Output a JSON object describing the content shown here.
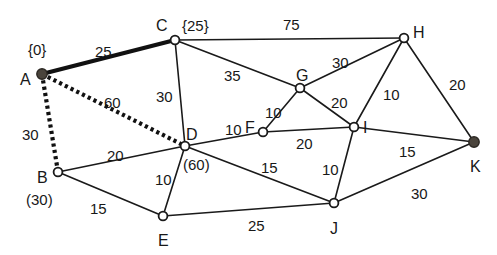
{
  "figure": {
    "background_color": "#ffffff",
    "line_color": "#1a1a1a",
    "filled_node_color": "#4a443c",
    "width": 497,
    "height": 255
  },
  "chart_data": {
    "type": "diagram",
    "subtype": "weighted-undirected-graph",
    "title": "",
    "nodes": [
      {
        "id": "A",
        "label": "A",
        "x": 42,
        "y": 74,
        "fill": "filled",
        "tag": "{0}",
        "tag_kind": "settled"
      },
      {
        "id": "B",
        "label": "B",
        "x": 58,
        "y": 172,
        "fill": "open",
        "tag": "(30)",
        "tag_kind": "tentative"
      },
      {
        "id": "C",
        "label": "C",
        "x": 175,
        "y": 40,
        "fill": "open",
        "tag": "{25}",
        "tag_kind": "settled"
      },
      {
        "id": "D",
        "label": "D",
        "x": 185,
        "y": 146,
        "fill": "open",
        "tag": "(60)",
        "tag_kind": "tentative"
      },
      {
        "id": "E",
        "label": "E",
        "x": 163,
        "y": 216,
        "fill": "open",
        "tag": "",
        "tag_kind": "none"
      },
      {
        "id": "F",
        "label": "F",
        "x": 263,
        "y": 132,
        "fill": "open",
        "tag": "",
        "tag_kind": "none"
      },
      {
        "id": "G",
        "label": "G",
        "x": 300,
        "y": 88,
        "fill": "open",
        "tag": "",
        "tag_kind": "none"
      },
      {
        "id": "H",
        "label": "H",
        "x": 404,
        "y": 38,
        "fill": "open",
        "tag": "",
        "tag_kind": "none"
      },
      {
        "id": "I",
        "label": "I",
        "x": 354,
        "y": 127,
        "fill": "open",
        "tag": "",
        "tag_kind": "none"
      },
      {
        "id": "J",
        "label": "J",
        "x": 334,
        "y": 203,
        "fill": "open",
        "tag": "",
        "tag_kind": "none"
      },
      {
        "id": "K",
        "label": "K",
        "x": 474,
        "y": 142,
        "fill": "filled",
        "tag": "",
        "tag_kind": "none"
      }
    ],
    "edges": [
      {
        "from": "A",
        "to": "C",
        "weight": 25,
        "style": "tree",
        "label_x": 95,
        "label_y": 44
      },
      {
        "from": "A",
        "to": "B",
        "weight": 30,
        "style": "dotted",
        "label_x": 22,
        "label_y": 127
      },
      {
        "from": "A",
        "to": "D",
        "weight": 60,
        "style": "dotted",
        "label_x": 104,
        "label_y": 95
      },
      {
        "from": "C",
        "to": "H",
        "weight": 75,
        "style": "plain",
        "label_x": 283,
        "label_y": 17
      },
      {
        "from": "C",
        "to": "D",
        "weight": 30,
        "style": "plain",
        "label_x": 156,
        "label_y": 89
      },
      {
        "from": "C",
        "to": "G",
        "weight": 35,
        "style": "plain",
        "label_x": 224,
        "label_y": 68
      },
      {
        "from": "B",
        "to": "D",
        "weight": 20,
        "style": "plain",
        "label_x": 107,
        "label_y": 148
      },
      {
        "from": "B",
        "to": "E",
        "weight": 15,
        "style": "plain",
        "label_x": 90,
        "label_y": 201
      },
      {
        "from": "D",
        "to": "E",
        "weight": 10,
        "style": "plain",
        "label_x": 155,
        "label_y": 172
      },
      {
        "from": "D",
        "to": "F",
        "weight": 10,
        "style": "plain",
        "label_x": 225,
        "label_y": 122
      },
      {
        "from": "D",
        "to": "J",
        "weight": 15,
        "style": "plain",
        "label_x": 261,
        "label_y": 160
      },
      {
        "from": "E",
        "to": "J",
        "weight": 25,
        "style": "plain",
        "label_x": 248,
        "label_y": 218
      },
      {
        "from": "F",
        "to": "G",
        "weight": 10,
        "style": "plain",
        "label_x": 265,
        "label_y": 105
      },
      {
        "from": "F",
        "to": "I",
        "weight": 20,
        "style": "plain",
        "label_x": 296,
        "label_y": 136
      },
      {
        "from": "G",
        "to": "H",
        "weight": 30,
        "style": "plain",
        "label_x": 332,
        "label_y": 55
      },
      {
        "from": "G",
        "to": "I",
        "weight": 20,
        "style": "plain",
        "label_x": 331,
        "label_y": 95
      },
      {
        "from": "H",
        "to": "I",
        "weight": 10,
        "style": "plain",
        "label_x": 383,
        "label_y": 87
      },
      {
        "from": "H",
        "to": "K",
        "weight": 20,
        "style": "plain",
        "label_x": 449,
        "label_y": 77
      },
      {
        "from": "I",
        "to": "J",
        "weight": 10,
        "style": "plain",
        "label_x": 322,
        "label_y": 162
      },
      {
        "from": "I",
        "to": "K",
        "weight": 15,
        "style": "plain",
        "label_x": 399,
        "label_y": 144
      },
      {
        "from": "J",
        "to": "K",
        "weight": 30,
        "style": "plain",
        "label_x": 411,
        "label_y": 186
      }
    ],
    "node_label_offsets": {
      "A": {
        "dx": -22,
        "dy": 6
      },
      "B": {
        "dx": -21,
        "dy": 6
      },
      "C": {
        "dx": -19,
        "dy": -14
      },
      "D": {
        "dx": 1,
        "dy": -11
      },
      "E": {
        "dx": -5,
        "dy": 25
      },
      "F": {
        "dx": -18,
        "dy": -4
      },
      "G": {
        "dx": -4,
        "dy": -12
      },
      "H": {
        "dx": 9,
        "dy": -5
      },
      "I": {
        "dx": 9,
        "dy": 1
      },
      "J": {
        "dx": -4,
        "dy": 26
      },
      "K": {
        "dx": -4,
        "dy": 25
      }
    },
    "node_tag_offsets": {
      "A": {
        "dx": -14,
        "dy": -24
      },
      "B": {
        "dx": -32,
        "dy": 28
      },
      "C": {
        "dx": 7,
        "dy": -14
      },
      "D": {
        "dx": -2,
        "dy": 19
      }
    }
  }
}
